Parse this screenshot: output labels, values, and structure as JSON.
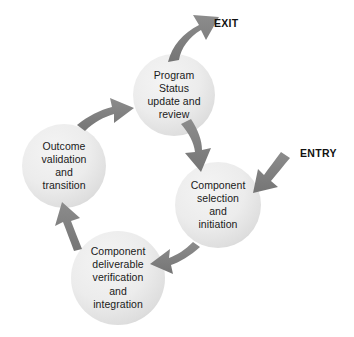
{
  "diagram": {
    "background_color": "#ffffff",
    "circle_fill_light": "#f0f0f0",
    "circle_fill_dark": "#d9d9d9",
    "arrow_color": "#7f7f7f",
    "text_color": "#1a1a1a",
    "nodes": [
      {
        "id": "program-status",
        "name": "program-status-node",
        "lines": [
          "Program",
          "Status",
          "update and",
          "review"
        ],
        "cx": 174,
        "cy": 95,
        "r": 41
      },
      {
        "id": "component-selection",
        "name": "component-selection-node",
        "lines": [
          "Component",
          "selection",
          "and",
          "initiation"
        ],
        "cx": 218,
        "cy": 205,
        "r": 43
      },
      {
        "id": "component-deliverable",
        "name": "component-deliverable-node",
        "lines": [
          "Component",
          "deliverable",
          "verification",
          "and",
          "integration"
        ],
        "cx": 118,
        "cy": 278,
        "r": 47
      },
      {
        "id": "outcome-validation",
        "name": "outcome-validation-node",
        "lines": [
          "Outcome",
          "validation",
          "and",
          "transition"
        ],
        "cx": 64,
        "cy": 166,
        "r": 42
      }
    ],
    "endpoints": [
      {
        "id": "exit",
        "label": "EXIT",
        "x": 214,
        "y": 17
      },
      {
        "id": "entry",
        "label": "ENTRY",
        "x": 300,
        "y": 147
      }
    ],
    "arrows": [
      {
        "id": "exit-arrow",
        "from": "program-status",
        "to": "exit"
      },
      {
        "id": "status-to-selection",
        "from": "program-status",
        "to": "component-selection"
      },
      {
        "id": "entry-arrow",
        "from": "entry",
        "to": "component-selection"
      },
      {
        "id": "selection-to-deliverable",
        "from": "component-selection",
        "to": "component-deliverable"
      },
      {
        "id": "deliverable-to-outcome",
        "from": "component-deliverable",
        "to": "outcome-validation"
      },
      {
        "id": "outcome-to-status",
        "from": "outcome-validation",
        "to": "program-status"
      }
    ]
  }
}
